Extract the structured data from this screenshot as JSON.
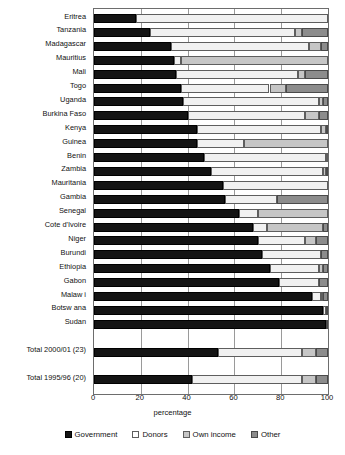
{
  "chart_data": {
    "type": "bar",
    "orientation": "horizontal",
    "stacked": true,
    "title": "",
    "xlabel": "percentage",
    "ylabel": "",
    "xlim": [
      0,
      100
    ],
    "xticks": [
      0,
      20,
      40,
      60,
      80,
      100
    ],
    "grid": true,
    "legend_position": "bottom",
    "series": [
      {
        "name": "Government",
        "color": "#141414"
      },
      {
        "name": "Donors",
        "color": "#f1f1f1"
      },
      {
        "name": "Own income",
        "color": "#c6c6c6"
      },
      {
        "name": "Other",
        "color": "#8c8c8c"
      }
    ],
    "categories": [
      "Eritrea",
      "Tanzania",
      "Madagascar",
      "Mauritius",
      "Mali",
      "Togo",
      "Uganda",
      "Burkina Faso",
      "Kenya",
      "Guinea",
      "Benin",
      "Zambia",
      "Mauritania",
      "Gambia",
      "Senegal",
      "Cote d'Ivoire",
      "Niger",
      "Burundi",
      "Ethiopia",
      "Gabon",
      "Malaw i",
      "Botsw ana",
      "Sudan",
      "",
      "Total 2000/01 (23)",
      "",
      "Total 1995/96 (20)"
    ],
    "rows": [
      {
        "category": "Eritrea",
        "government": 18,
        "donors": 82,
        "own_income": 0,
        "other": 0
      },
      {
        "category": "Tanzania",
        "government": 24,
        "donors": 62,
        "own_income": 3,
        "other": 11
      },
      {
        "category": "Madagascar",
        "government": 33,
        "donors": 59,
        "own_income": 5,
        "other": 3
      },
      {
        "category": "Mauritius",
        "government": 34,
        "donors": 3,
        "own_income": 63,
        "other": 0
      },
      {
        "category": "Mali",
        "government": 35,
        "donors": 52,
        "own_income": 3,
        "other": 10
      },
      {
        "category": "Togo",
        "government": 37,
        "donors": 38,
        "own_income": 7,
        "other": 18
      },
      {
        "category": "Uganda",
        "government": 38,
        "donors": 58,
        "own_income": 2,
        "other": 2
      },
      {
        "category": "Burkina Faso",
        "government": 40,
        "donors": 50,
        "own_income": 6,
        "other": 4
      },
      {
        "category": "Kenya",
        "government": 44,
        "donors": 53,
        "own_income": 2,
        "other": 1
      },
      {
        "category": "Guinea",
        "government": 44,
        "donors": 20,
        "own_income": 36,
        "other": 0
      },
      {
        "category": "Benin",
        "government": 47,
        "donors": 52,
        "own_income": 1,
        "other": 0
      },
      {
        "category": "Zambia",
        "government": 50,
        "donors": 48,
        "own_income": 1,
        "other": 1
      },
      {
        "category": "Mauritania",
        "government": 55,
        "donors": 45,
        "own_income": 0,
        "other": 0
      },
      {
        "category": "Gambia",
        "government": 56,
        "donors": 22,
        "own_income": 0,
        "other": 22
      },
      {
        "category": "Senegal",
        "government": 62,
        "donors": 8,
        "own_income": 30,
        "other": 0
      },
      {
        "category": "Cote d'Ivoire",
        "government": 68,
        "donors": 6,
        "own_income": 24,
        "other": 2
      },
      {
        "category": "Niger",
        "government": 70,
        "donors": 20,
        "own_income": 5,
        "other": 5
      },
      {
        "category": "Burundi",
        "government": 72,
        "donors": 25,
        "own_income": 0,
        "other": 3
      },
      {
        "category": "Ethiopia",
        "government": 75,
        "donors": 21,
        "own_income": 2,
        "other": 2
      },
      {
        "category": "Gabon",
        "government": 79,
        "donors": 17,
        "own_income": 0,
        "other": 4
      },
      {
        "category": "Malaw i",
        "government": 93,
        "donors": 4,
        "own_income": 1,
        "other": 2
      },
      {
        "category": "Botsw ana",
        "government": 98,
        "donors": 1,
        "own_income": 0,
        "other": 1
      },
      {
        "category": "Sudan",
        "government": 99,
        "donors": 0,
        "own_income": 0,
        "other": 1
      },
      {
        "category": "Total 2000/01 (23)",
        "government": 53,
        "donors": 36,
        "own_income": 6,
        "other": 5
      },
      {
        "category": "Total 1995/96 (20)",
        "government": 42,
        "donors": 47,
        "own_income": 6,
        "other": 5
      }
    ]
  },
  "axis": {
    "x_title": "percentage",
    "tick_labels": [
      "0",
      "20",
      "40",
      "60",
      "80",
      "100"
    ]
  },
  "legend": {
    "items": [
      {
        "label": "Government",
        "swatch": "government-swatch-icon"
      },
      {
        "label": "Donors",
        "swatch": "donors-swatch-icon"
      },
      {
        "label": "Own income",
        "swatch": "own-income-swatch-icon"
      },
      {
        "label": "Other",
        "swatch": "other-swatch-icon"
      }
    ]
  }
}
